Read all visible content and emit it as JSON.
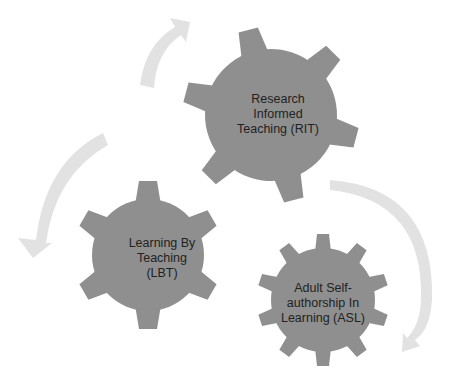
{
  "diagram": {
    "type": "cycle-of-gears",
    "colors": {
      "gear_fill": "#8f8f8f",
      "arrow_fill": "#e2e2e2",
      "text": "#222222",
      "background": "#ffffff"
    },
    "gears": [
      {
        "id": "rit",
        "label": "Research Informed Teaching (RIT)",
        "lines": [
          "Research",
          "Informed",
          "Teaching (RIT)"
        ]
      },
      {
        "id": "lbt",
        "label": "Learning By Teaching (LBT)",
        "lines": [
          "Learning By",
          "Teaching",
          "(LBT)"
        ]
      },
      {
        "id": "asl",
        "label": "Adult Self-authorship In Learning (ASL)",
        "lines": [
          "Adult Self-",
          "authorship In",
          "Learning (ASL)"
        ]
      }
    ],
    "arrows": [
      {
        "id": "arrow-lbt-to-rit",
        "from": "lbt",
        "to": "rit",
        "direction": "up-right"
      },
      {
        "id": "arrow-rit-to-asl",
        "from": "rit",
        "to": "asl",
        "direction": "clockwise-down"
      },
      {
        "id": "arrow-to-lbt",
        "from": "rit",
        "to": "lbt",
        "direction": "down-left"
      }
    ]
  }
}
